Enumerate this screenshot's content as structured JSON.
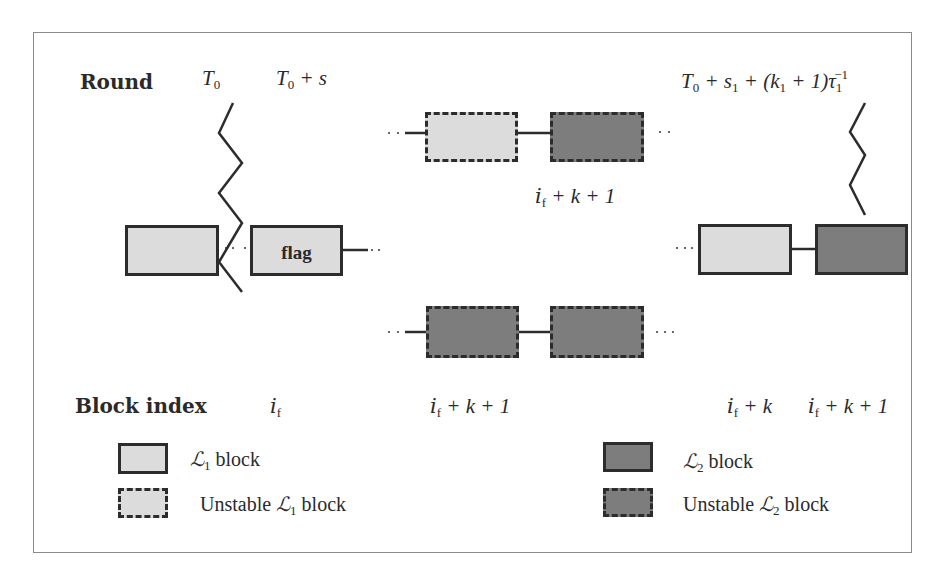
{
  "diagram": {
    "row_labels": {
      "round": "Round",
      "block_index": "Block index"
    },
    "round_markers": {
      "t0": {
        "base": "T",
        "sub": "0"
      },
      "t0_plus_s": {
        "base": "T",
        "sub": "0",
        "rest": " + s"
      },
      "t_end": {
        "text": "T",
        "sub0": "0",
        "part2": " + s",
        "sub1": "1",
        "part3": " + (k",
        "sub2": "1",
        "part4": " + 1)τ",
        "sub3": "1",
        "sup": "−1"
      }
    },
    "blocks": [
      {
        "id": "b1",
        "type": "L1",
        "stable": true,
        "label": ""
      },
      {
        "id": "flag",
        "type": "L1",
        "stable": true,
        "label": "flag"
      },
      {
        "id": "top-l1",
        "type": "L1",
        "stable": false,
        "label": ""
      },
      {
        "id": "top-l2",
        "type": "L2",
        "stable": false,
        "label": ""
      },
      {
        "id": "bot-l2a",
        "type": "L2",
        "stable": false,
        "label": ""
      },
      {
        "id": "bot-l2b",
        "type": "L2",
        "stable": false,
        "label": ""
      },
      {
        "id": "right-l1",
        "type": "L1",
        "stable": true,
        "label": ""
      },
      {
        "id": "right-l2",
        "type": "L2",
        "stable": true,
        "label": ""
      }
    ],
    "index_labels": {
      "i_f": {
        "base": "i",
        "sub": "f",
        "rest": ""
      },
      "top_branch": {
        "base": "i",
        "sub": "f",
        "rest": " + k + 1"
      },
      "bottom_branch": {
        "base": "i",
        "sub": "f",
        "rest": " + k + 1"
      },
      "right_l1": {
        "base": "i",
        "sub": "f",
        "rest": " + k"
      },
      "right_l2": {
        "base": "i",
        "sub": "f",
        "rest": " + k + 1"
      }
    },
    "legend": [
      {
        "name": "L1 block",
        "symbol": "ℒ",
        "sub": "1",
        "prefix": "",
        "suffix": " block",
        "fill": "#dcdcdc",
        "border": "solid"
      },
      {
        "name": "Unstable L1 block",
        "symbol": "ℒ",
        "sub": "1",
        "prefix": "Unstable ",
        "suffix": " block",
        "fill": "#dcdcdc",
        "border": "dashed"
      },
      {
        "name": "L2 block",
        "symbol": "ℒ",
        "sub": "2",
        "prefix": "",
        "suffix": " block",
        "fill": "#7d7d7d",
        "border": "solid"
      },
      {
        "name": "Unstable L2 block",
        "symbol": "ℒ",
        "sub": "2",
        "prefix": "Unstable ",
        "suffix": " block",
        "fill": "#7d7d7d",
        "border": "dashed"
      }
    ],
    "colors": {
      "l1_fill": "#dcdcdc",
      "l2_fill": "#7d7d7d",
      "stroke": "#2c2c2c",
      "frame": "#8a8a8a"
    }
  }
}
